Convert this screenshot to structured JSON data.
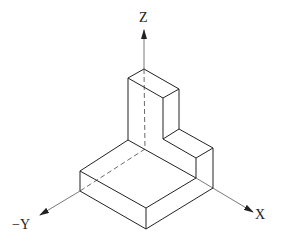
{
  "diagram": {
    "type": "isometric-projection",
    "colors": {
      "line": "#222222",
      "axis": "#555555",
      "background": "#ffffff"
    },
    "axes": {
      "z_label": "Z",
      "x_label": "X",
      "y_label": "−Y"
    },
    "parts": [
      {
        "name": "base-slab"
      },
      {
        "name": "upright-block"
      },
      {
        "name": "step-block"
      }
    ]
  }
}
